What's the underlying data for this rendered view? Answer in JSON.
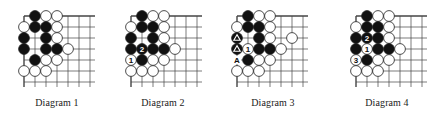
{
  "figure": {
    "grid": {
      "cols": 7,
      "rows": 7,
      "spacing": 11,
      "top": 16,
      "extend": 5
    },
    "colors": {
      "line": "#444444",
      "black_stone": "#111111",
      "white_stone": "#ffffff",
      "stone_outline": "#222222"
    },
    "diagrams": [
      {
        "caption": "Diagram 1",
        "left": 24,
        "stones": [
          {
            "c": 1,
            "r": 0,
            "color": "B"
          },
          {
            "c": 2,
            "r": 0,
            "color": "W"
          },
          {
            "c": 3,
            "r": 0,
            "color": "W"
          },
          {
            "c": 0,
            "r": 1,
            "color": "W"
          },
          {
            "c": 1,
            "r": 1,
            "color": "B"
          },
          {
            "c": 2,
            "r": 1,
            "color": "B"
          },
          {
            "c": 3,
            "r": 1,
            "color": "W"
          },
          {
            "c": 0,
            "r": 2,
            "color": "B"
          },
          {
            "c": 2,
            "r": 2,
            "color": "B"
          },
          {
            "c": 3,
            "r": 2,
            "color": "W"
          },
          {
            "c": 0,
            "r": 3,
            "color": "B"
          },
          {
            "c": 2,
            "r": 3,
            "color": "B"
          },
          {
            "c": 3,
            "r": 3,
            "color": "B"
          },
          {
            "c": 4,
            "r": 3,
            "color": "W"
          },
          {
            "c": 1,
            "r": 4,
            "color": "B"
          },
          {
            "c": 2,
            "r": 4,
            "color": "W"
          },
          {
            "c": 3,
            "r": 4,
            "color": "W"
          },
          {
            "c": 0,
            "r": 5,
            "color": "W"
          },
          {
            "c": 1,
            "r": 5,
            "color": "W"
          },
          {
            "c": 2,
            "r": 5,
            "color": "W"
          }
        ],
        "labels": []
      },
      {
        "caption": "Diagram 2",
        "left": 131,
        "stones": [
          {
            "c": 1,
            "r": 0,
            "color": "B"
          },
          {
            "c": 2,
            "r": 0,
            "color": "W"
          },
          {
            "c": 3,
            "r": 0,
            "color": "W"
          },
          {
            "c": 0,
            "r": 1,
            "color": "W"
          },
          {
            "c": 1,
            "r": 1,
            "color": "B"
          },
          {
            "c": 2,
            "r": 1,
            "color": "B"
          },
          {
            "c": 3,
            "r": 1,
            "color": "W"
          },
          {
            "c": 0,
            "r": 2,
            "color": "B"
          },
          {
            "c": 2,
            "r": 2,
            "color": "B"
          },
          {
            "c": 3,
            "r": 2,
            "color": "W"
          },
          {
            "c": 0,
            "r": 3,
            "color": "B"
          },
          {
            "c": 1,
            "r": 3,
            "color": "B",
            "mark": "2"
          },
          {
            "c": 2,
            "r": 3,
            "color": "B"
          },
          {
            "c": 3,
            "r": 3,
            "color": "B"
          },
          {
            "c": 4,
            "r": 3,
            "color": "W"
          },
          {
            "c": 0,
            "r": 4,
            "color": "W",
            "mark": "1"
          },
          {
            "c": 1,
            "r": 4,
            "color": "B"
          },
          {
            "c": 2,
            "r": 4,
            "color": "W"
          },
          {
            "c": 3,
            "r": 4,
            "color": "W"
          },
          {
            "c": 0,
            "r": 5,
            "color": "W"
          },
          {
            "c": 1,
            "r": 5,
            "color": "W"
          },
          {
            "c": 2,
            "r": 5,
            "color": "W"
          }
        ],
        "labels": []
      },
      {
        "caption": "Diagram 3",
        "left": 237,
        "stones": [
          {
            "c": 1,
            "r": 0,
            "color": "B"
          },
          {
            "c": 2,
            "r": 0,
            "color": "W"
          },
          {
            "c": 3,
            "r": 0,
            "color": "W"
          },
          {
            "c": 0,
            "r": 1,
            "color": "W"
          },
          {
            "c": 1,
            "r": 1,
            "color": "B"
          },
          {
            "c": 2,
            "r": 1,
            "color": "B"
          },
          {
            "c": 3,
            "r": 1,
            "color": "W"
          },
          {
            "c": 0,
            "r": 2,
            "color": "B",
            "mark": "triangle"
          },
          {
            "c": 2,
            "r": 2,
            "color": "B"
          },
          {
            "c": 3,
            "r": 2,
            "color": "W"
          },
          {
            "c": 5,
            "r": 2,
            "color": "W"
          },
          {
            "c": 0,
            "r": 3,
            "color": "B",
            "mark": "triangle"
          },
          {
            "c": 1,
            "r": 3,
            "color": "W",
            "mark": "1"
          },
          {
            "c": 2,
            "r": 3,
            "color": "B"
          },
          {
            "c": 3,
            "r": 3,
            "color": "B"
          },
          {
            "c": 4,
            "r": 3,
            "color": "W"
          },
          {
            "c": 1,
            "r": 4,
            "color": "B"
          },
          {
            "c": 2,
            "r": 4,
            "color": "W"
          },
          {
            "c": 3,
            "r": 4,
            "color": "W"
          },
          {
            "c": 0,
            "r": 5,
            "color": "W"
          },
          {
            "c": 1,
            "r": 5,
            "color": "W"
          },
          {
            "c": 2,
            "r": 5,
            "color": "W"
          }
        ],
        "labels": [
          {
            "c": 0,
            "r": 4,
            "text": "A"
          }
        ]
      },
      {
        "caption": "Diagram 4",
        "left": 356,
        "stones": [
          {
            "c": 1,
            "r": 0,
            "color": "B"
          },
          {
            "c": 2,
            "r": 0,
            "color": "W"
          },
          {
            "c": 3,
            "r": 0,
            "color": "W"
          },
          {
            "c": 0,
            "r": 1,
            "color": "W"
          },
          {
            "c": 1,
            "r": 1,
            "color": "B"
          },
          {
            "c": 2,
            "r": 1,
            "color": "B"
          },
          {
            "c": 3,
            "r": 1,
            "color": "W"
          },
          {
            "c": 0,
            "r": 2,
            "color": "B"
          },
          {
            "c": 1,
            "r": 2,
            "color": "B",
            "mark": "2"
          },
          {
            "c": 2,
            "r": 2,
            "color": "B"
          },
          {
            "c": 3,
            "r": 2,
            "color": "W"
          },
          {
            "c": 0,
            "r": 3,
            "color": "B"
          },
          {
            "c": 1,
            "r": 3,
            "color": "W",
            "mark": "1"
          },
          {
            "c": 2,
            "r": 3,
            "color": "B"
          },
          {
            "c": 3,
            "r": 3,
            "color": "B"
          },
          {
            "c": 4,
            "r": 3,
            "color": "W"
          },
          {
            "c": 0,
            "r": 4,
            "color": "W",
            "mark": "3"
          },
          {
            "c": 1,
            "r": 4,
            "color": "B"
          },
          {
            "c": 2,
            "r": 4,
            "color": "W"
          },
          {
            "c": 3,
            "r": 4,
            "color": "W"
          },
          {
            "c": 0,
            "r": 5,
            "color": "W"
          },
          {
            "c": 1,
            "r": 5,
            "color": "W"
          },
          {
            "c": 2,
            "r": 5,
            "color": "W"
          }
        ],
        "labels": []
      }
    ]
  }
}
